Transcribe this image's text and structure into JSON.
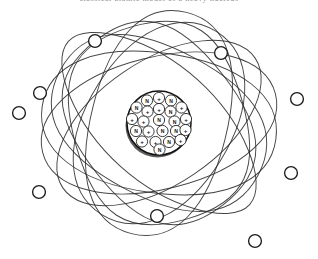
{
  "figure": {
    "name": "atom-diagram",
    "caption_remnant": "classical atomic model of a heavy nucleus",
    "background_color": "#ffffff",
    "line_color": "#2b2b2b",
    "electron_fill": "#ffffff",
    "electron_stroke": "#1c1c1c",
    "nucleus_stroke": "#111111",
    "nucleus_shadow": "#3a3a3a",
    "width": 318,
    "height": 259
  },
  "nucleus": {
    "label": "nucleus",
    "center_x": 159,
    "center_y": 123,
    "radius": 32,
    "proton_symbol": "+",
    "neutron_symbol": "N",
    "proton_count": 12,
    "neutron_count": 11,
    "nucleon_radius": 5.6,
    "nucleons": [
      {
        "x": 159.0,
        "y": 98.0,
        "type": "proton",
        "symbol": "+"
      },
      {
        "x": 147.0,
        "y": 100.5,
        "type": "neutron",
        "symbol": "N"
      },
      {
        "x": 171.0,
        "y": 100.5,
        "type": "neutron",
        "symbol": "N"
      },
      {
        "x": 136.5,
        "y": 107.5,
        "type": "neutron",
        "symbol": "N"
      },
      {
        "x": 159.0,
        "y": 109.0,
        "type": "proton",
        "symbol": "+"
      },
      {
        "x": 181.5,
        "y": 107.5,
        "type": "proton",
        "symbol": "+"
      },
      {
        "x": 147.5,
        "y": 111.5,
        "type": "proton",
        "symbol": "+"
      },
      {
        "x": 170.5,
        "y": 111.5,
        "type": "neutron",
        "symbol": "N"
      },
      {
        "x": 132.0,
        "y": 119.0,
        "type": "proton",
        "symbol": "+"
      },
      {
        "x": 143.5,
        "y": 121.5,
        "type": "proton",
        "symbol": "+"
      },
      {
        "x": 159.0,
        "y": 120.0,
        "type": "neutron",
        "symbol": "N"
      },
      {
        "x": 174.5,
        "y": 121.5,
        "type": "neutron",
        "symbol": "N"
      },
      {
        "x": 186.0,
        "y": 119.0,
        "type": "proton",
        "symbol": "+"
      },
      {
        "x": 136.0,
        "y": 131.0,
        "type": "neutron",
        "symbol": "N"
      },
      {
        "x": 148.5,
        "y": 131.5,
        "type": "proton",
        "symbol": "+"
      },
      {
        "x": 162.5,
        "y": 131.0,
        "type": "neutron",
        "symbol": "N"
      },
      {
        "x": 176.0,
        "y": 131.0,
        "type": "neutron",
        "symbol": "N"
      },
      {
        "x": 185.5,
        "y": 130.0,
        "type": "proton",
        "symbol": "+"
      },
      {
        "x": 142.0,
        "y": 141.5,
        "type": "proton",
        "symbol": "+"
      },
      {
        "x": 155.5,
        "y": 142.0,
        "type": "proton",
        "symbol": "+"
      },
      {
        "x": 169.0,
        "y": 142.0,
        "type": "neutron",
        "symbol": "N"
      },
      {
        "x": 180.5,
        "y": 140.0,
        "type": "proton",
        "symbol": "+"
      },
      {
        "x": 159.5,
        "y": 149.5,
        "type": "neutron",
        "symbol": "N"
      }
    ]
  },
  "orbits": {
    "label": "electron-orbits",
    "count": 9,
    "shape": "rounded-ellipse",
    "paths": [
      {
        "id": "orbit-1",
        "rx": 118,
        "ry": 70,
        "rotation": 8,
        "corner": 0.62
      },
      {
        "id": "orbit-2",
        "rx": 120,
        "ry": 66,
        "rotation": -14,
        "corner": 0.58
      },
      {
        "id": "orbit-3",
        "rx": 112,
        "ry": 74,
        "rotation": 28,
        "corner": 0.66
      },
      {
        "id": "orbit-4",
        "rx": 116,
        "ry": 62,
        "rotation": -34,
        "corner": 0.55
      },
      {
        "id": "orbit-5",
        "rx": 104,
        "ry": 80,
        "rotation": 52,
        "corner": 0.7
      },
      {
        "id": "orbit-6",
        "rx": 108,
        "ry": 72,
        "rotation": -58,
        "corner": 0.6
      },
      {
        "id": "orbit-7",
        "rx": 100,
        "ry": 86,
        "rotation": 74,
        "corner": 0.72
      },
      {
        "id": "orbit-8",
        "rx": 114,
        "ry": 68,
        "rotation": -76,
        "corner": 0.64
      },
      {
        "id": "orbit-9",
        "rx": 122,
        "ry": 58,
        "rotation": 42,
        "corner": 0.5
      }
    ]
  },
  "electrons": {
    "label": "electrons",
    "count": 9,
    "radius": 6.4,
    "positions": [
      {
        "id": "electron-1",
        "x": 95,
        "y": 41
      },
      {
        "id": "electron-2",
        "x": 221,
        "y": 53
      },
      {
        "id": "electron-3",
        "x": 40,
        "y": 93
      },
      {
        "id": "electron-4",
        "x": 297,
        "y": 99
      },
      {
        "id": "electron-5",
        "x": 19,
        "y": 113
      },
      {
        "id": "electron-6",
        "x": 291,
        "y": 173
      },
      {
        "id": "electron-7",
        "x": 39,
        "y": 192
      },
      {
        "id": "electron-8",
        "x": 157,
        "y": 216
      },
      {
        "id": "electron-9",
        "x": 255,
        "y": 241
      }
    ]
  }
}
